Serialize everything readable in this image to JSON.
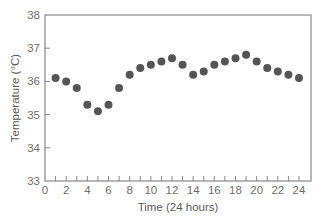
{
  "chart_data": {
    "type": "scatter",
    "title": "",
    "xlabel": "Time (24 hours)",
    "ylabel": "Temperature (°C)",
    "xlim": [
      0,
      25
    ],
    "ylim": [
      33,
      38
    ],
    "x_ticks": [
      0,
      2,
      4,
      6,
      8,
      10,
      12,
      14,
      16,
      18,
      20,
      22,
      24
    ],
    "x_minor_ticks": [
      1,
      3,
      5,
      7,
      9,
      11,
      13,
      15,
      17,
      19,
      21,
      23
    ],
    "y_ticks": [
      33,
      34,
      35,
      36,
      37,
      38
    ],
    "grid": false,
    "legend": null,
    "marker_color": "#555555",
    "axis_color": "#888888",
    "series": [
      {
        "name": "Body temperature",
        "x": [
          1,
          2,
          3,
          4,
          5,
          6,
          7,
          8,
          9,
          10,
          11,
          12,
          13,
          14,
          15,
          16,
          17,
          18,
          19,
          20,
          21,
          22,
          23,
          24
        ],
        "values": [
          36.1,
          36.0,
          35.8,
          35.3,
          35.1,
          35.3,
          35.8,
          36.2,
          36.4,
          36.5,
          36.6,
          36.7,
          36.5,
          36.2,
          36.3,
          36.5,
          36.6,
          36.7,
          36.8,
          36.6,
          36.4,
          36.3,
          36.2,
          36.1
        ]
      }
    ]
  }
}
